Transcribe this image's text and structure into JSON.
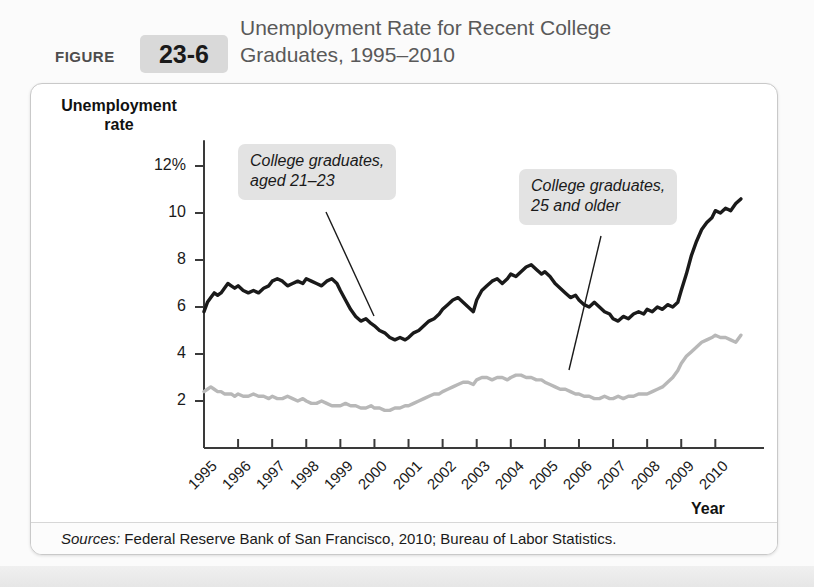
{
  "figure": {
    "label": "FIGURE",
    "number": "23-6",
    "title": "Unemployment Rate for Recent College Graduates, 1995–2010"
  },
  "sources": {
    "prefix": "Sources:",
    "text": " Federal Reserve Bank of San Francisco, 2010; Bureau of Labor Statistics."
  },
  "annotations": {
    "series_a": "College graduates,\naged 21–23",
    "series_b": "College graduates,\n25 and older"
  },
  "colors": {
    "series_a": "#1a1a1a",
    "series_b": "#b8b8b8",
    "axis": "#3a3a3a",
    "callout_bg": "#e3e3e3",
    "panel_border": "#c9c9c9",
    "figure_box": "#d9d9d9",
    "title_text": "#595959"
  },
  "chart_data": {
    "type": "line",
    "title": "Unemployment Rate for Recent College Graduates, 1995–2010",
    "xlabel": "Year",
    "ylabel": "Unemployment rate",
    "ylim": [
      0,
      12.8
    ],
    "yticks": [
      "2",
      "4",
      "6",
      "8",
      "10",
      "12%"
    ],
    "ytick_values": [
      2,
      4,
      6,
      8,
      10,
      12
    ],
    "xlim": [
      1995,
      2010.9
    ],
    "xticks": [
      "1995",
      "1996",
      "1997",
      "1998",
      "1999",
      "2000",
      "2001",
      "2002",
      "2003",
      "2004",
      "2005",
      "2006",
      "2007",
      "2008",
      "2009",
      "2010"
    ],
    "grid": false,
    "legend": "annotated callouts",
    "series": [
      {
        "name": "College graduates, aged 21–23",
        "color": "#1a1a1a",
        "x": [
          1995.0,
          1995.1,
          1995.2,
          1995.3,
          1995.4,
          1995.5,
          1995.6,
          1995.7,
          1995.8,
          1995.9,
          1996.0,
          1996.15,
          1996.3,
          1996.45,
          1996.6,
          1996.75,
          1996.9,
          1997.0,
          1997.15,
          1997.3,
          1997.45,
          1997.6,
          1997.75,
          1997.9,
          1998.0,
          1998.15,
          1998.3,
          1998.45,
          1998.6,
          1998.75,
          1998.9,
          1999.0,
          1999.15,
          1999.3,
          1999.45,
          1999.6,
          1999.75,
          1999.9,
          2000.0,
          2000.15,
          2000.3,
          2000.45,
          2000.6,
          2000.75,
          2000.9,
          2001.0,
          2001.15,
          2001.3,
          2001.45,
          2001.6,
          2001.75,
          2001.9,
          2002.0,
          2002.15,
          2002.3,
          2002.45,
          2002.6,
          2002.75,
          2002.9,
          2003.0,
          2003.15,
          2003.3,
          2003.45,
          2003.6,
          2003.75,
          2003.9,
          2004.0,
          2004.15,
          2004.3,
          2004.45,
          2004.6,
          2004.75,
          2004.9,
          2005.0,
          2005.15,
          2005.3,
          2005.45,
          2005.6,
          2005.75,
          2005.9,
          2006.0,
          2006.15,
          2006.3,
          2006.45,
          2006.6,
          2006.75,
          2006.9,
          2007.0,
          2007.15,
          2007.3,
          2007.45,
          2007.6,
          2007.75,
          2007.9,
          2008.0,
          2008.15,
          2008.3,
          2008.45,
          2008.6,
          2008.75,
          2008.9,
          2009.0,
          2009.15,
          2009.3,
          2009.45,
          2009.6,
          2009.75,
          2009.9,
          2010.0,
          2010.15,
          2010.3,
          2010.45,
          2010.6,
          2010.75
        ],
        "y": [
          5.8,
          6.2,
          6.4,
          6.6,
          6.5,
          6.6,
          6.8,
          7.0,
          6.9,
          6.8,
          6.9,
          6.7,
          6.6,
          6.7,
          6.6,
          6.8,
          6.9,
          7.1,
          7.2,
          7.1,
          6.9,
          7.0,
          7.1,
          7.0,
          7.2,
          7.1,
          7.0,
          6.9,
          7.1,
          7.2,
          7.0,
          6.7,
          6.3,
          5.9,
          5.6,
          5.4,
          5.5,
          5.3,
          5.2,
          5.0,
          4.9,
          4.7,
          4.6,
          4.7,
          4.6,
          4.7,
          4.9,
          5.0,
          5.2,
          5.4,
          5.5,
          5.7,
          5.9,
          6.1,
          6.3,
          6.4,
          6.2,
          6.0,
          5.8,
          6.3,
          6.7,
          6.9,
          7.1,
          7.2,
          7.0,
          7.2,
          7.4,
          7.3,
          7.5,
          7.7,
          7.8,
          7.6,
          7.4,
          7.5,
          7.3,
          7.0,
          6.8,
          6.6,
          6.4,
          6.5,
          6.3,
          6.1,
          6.0,
          6.2,
          6.0,
          5.8,
          5.7,
          5.5,
          5.4,
          5.6,
          5.5,
          5.7,
          5.8,
          5.7,
          5.9,
          5.8,
          6.0,
          5.9,
          6.1,
          6.0,
          6.2,
          6.7,
          7.4,
          8.2,
          8.8,
          9.3,
          9.6,
          9.8,
          10.1,
          10.0,
          10.2,
          10.1,
          10.4,
          10.6
        ]
      },
      {
        "name": "College graduates, 25 and older",
        "color": "#b8b8b8",
        "x": [
          1995.0,
          1995.1,
          1995.2,
          1995.3,
          1995.4,
          1995.5,
          1995.6,
          1995.7,
          1995.8,
          1995.9,
          1996.0,
          1996.15,
          1996.3,
          1996.45,
          1996.6,
          1996.75,
          1996.9,
          1997.0,
          1997.15,
          1997.3,
          1997.45,
          1997.6,
          1997.75,
          1997.9,
          1998.0,
          1998.15,
          1998.3,
          1998.45,
          1998.6,
          1998.75,
          1998.9,
          1999.0,
          1999.15,
          1999.3,
          1999.45,
          1999.6,
          1999.75,
          1999.9,
          2000.0,
          2000.15,
          2000.3,
          2000.45,
          2000.6,
          2000.75,
          2000.9,
          2001.0,
          2001.15,
          2001.3,
          2001.45,
          2001.6,
          2001.75,
          2001.9,
          2002.0,
          2002.15,
          2002.3,
          2002.45,
          2002.6,
          2002.75,
          2002.9,
          2003.0,
          2003.15,
          2003.3,
          2003.45,
          2003.6,
          2003.75,
          2003.9,
          2004.0,
          2004.15,
          2004.3,
          2004.45,
          2004.6,
          2004.75,
          2004.9,
          2005.0,
          2005.15,
          2005.3,
          2005.45,
          2005.6,
          2005.75,
          2005.9,
          2006.0,
          2006.15,
          2006.3,
          2006.45,
          2006.6,
          2006.75,
          2006.9,
          2007.0,
          2007.15,
          2007.3,
          2007.45,
          2007.6,
          2007.75,
          2007.9,
          2008.0,
          2008.15,
          2008.3,
          2008.45,
          2008.6,
          2008.75,
          2008.9,
          2009.0,
          2009.15,
          2009.3,
          2009.45,
          2009.6,
          2009.75,
          2009.9,
          2010.0,
          2010.15,
          2010.3,
          2010.45,
          2010.6,
          2010.75
        ],
        "y": [
          2.4,
          2.5,
          2.6,
          2.5,
          2.4,
          2.4,
          2.3,
          2.3,
          2.3,
          2.2,
          2.3,
          2.2,
          2.2,
          2.3,
          2.2,
          2.2,
          2.1,
          2.2,
          2.1,
          2.1,
          2.2,
          2.1,
          2.0,
          2.1,
          2.0,
          1.9,
          1.9,
          2.0,
          1.9,
          1.8,
          1.8,
          1.8,
          1.9,
          1.8,
          1.8,
          1.7,
          1.7,
          1.8,
          1.7,
          1.7,
          1.6,
          1.6,
          1.7,
          1.7,
          1.8,
          1.8,
          1.9,
          2.0,
          2.1,
          2.2,
          2.3,
          2.3,
          2.4,
          2.5,
          2.6,
          2.7,
          2.8,
          2.8,
          2.7,
          2.9,
          3.0,
          3.0,
          2.9,
          3.0,
          3.0,
          2.9,
          3.0,
          3.1,
          3.1,
          3.0,
          3.0,
          2.9,
          2.9,
          2.8,
          2.7,
          2.6,
          2.5,
          2.5,
          2.4,
          2.3,
          2.3,
          2.2,
          2.2,
          2.1,
          2.1,
          2.2,
          2.1,
          2.1,
          2.2,
          2.1,
          2.2,
          2.2,
          2.3,
          2.3,
          2.3,
          2.4,
          2.5,
          2.6,
          2.8,
          3.0,
          3.3,
          3.6,
          3.9,
          4.1,
          4.3,
          4.5,
          4.6,
          4.7,
          4.8,
          4.7,
          4.7,
          4.6,
          4.5,
          4.8
        ]
      }
    ]
  }
}
